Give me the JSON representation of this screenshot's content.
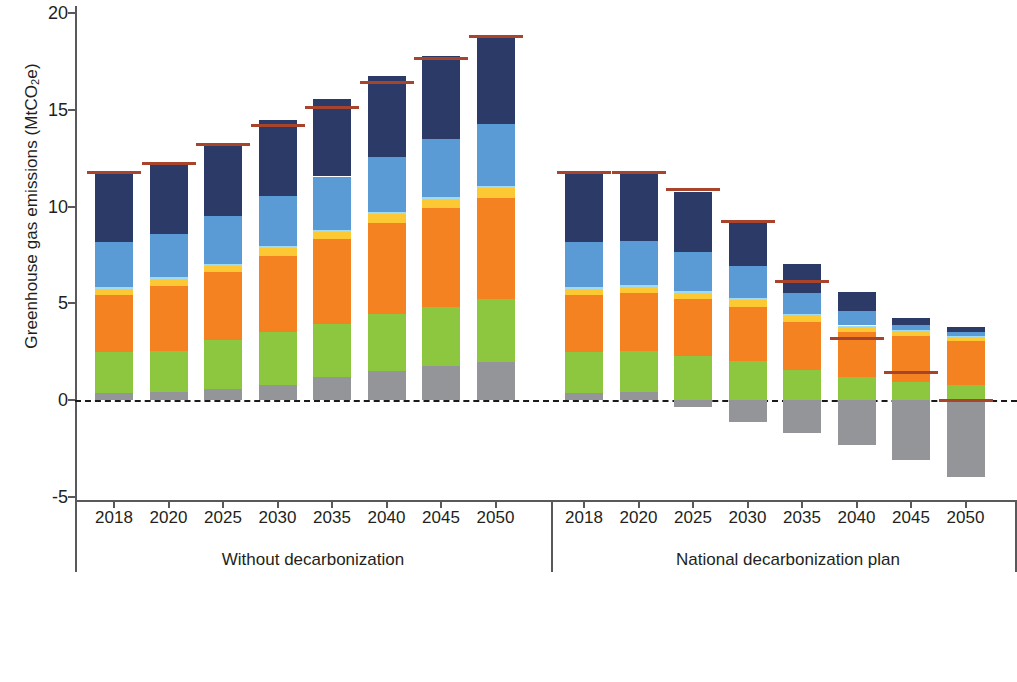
{
  "axis": {
    "y_label_main": "Greenhouse gas emissions (MtCO",
    "y_label_sub": "2",
    "y_label_tail": "e)",
    "y_ticks": [
      "20",
      "15",
      "10",
      "5",
      "0",
      "-5"
    ]
  },
  "legend": {
    "title": "Sectors",
    "items": [
      {
        "label": "Public and private transport",
        "color": "#2b3a67",
        "type": "swatch"
      },
      {
        "label": "Freight",
        "color": "#5b9bd5",
        "type": "swatch"
      },
      {
        "label": "Electricity",
        "color": "#9fdcf3",
        "type": "swatch"
      },
      {
        "label": "Buildings",
        "color": "#fcc934",
        "type": "swatch"
      },
      {
        "label": "Industry",
        "color": "#f58220",
        "type": "swatch"
      },
      {
        "label": "Waste",
        "color": "#8dc63f",
        "type": "swatch"
      },
      {
        "label": "Agriculture, livestock, and forestry",
        "color": "#939598",
        "type": "swatch"
      },
      {
        "label": "Net emissions",
        "color": "#a8432c",
        "type": "line"
      }
    ]
  },
  "chart_data": {
    "type": "bar",
    "subtype": "stacked",
    "title": "",
    "xlabel": "",
    "ylabel": "Greenhouse gas emissions (MtCO2e)",
    "ylim": [
      -5,
      20
    ],
    "ytick_step": 5,
    "grid": false,
    "zero_reference_line": true,
    "legend_position": "bottom",
    "groups": [
      {
        "name": "Without decarbonization",
        "categories": [
          "2018",
          "2020",
          "2025",
          "2030",
          "2035",
          "2040",
          "2045",
          "2050"
        ]
      },
      {
        "name": "National decarbonization plan",
        "categories": [
          "2018",
          "2020",
          "2025",
          "2030",
          "2035",
          "2040",
          "2045",
          "2050"
        ]
      }
    ],
    "series": [
      {
        "name": "Agriculture, livestock, and forestry",
        "color": "#939598",
        "values": [
          0.35,
          0.4,
          0.55,
          0.8,
          1.2,
          1.5,
          1.75,
          1.95,
          0.35,
          0.4,
          -0.35,
          -1.15,
          -1.7,
          -2.35,
          -3.1,
          -4.0
        ]
      },
      {
        "name": "Waste",
        "color": "#8dc63f",
        "values": [
          2.15,
          2.15,
          2.55,
          2.7,
          2.75,
          2.95,
          3.05,
          3.25,
          2.15,
          2.15,
          2.25,
          2.0,
          1.55,
          1.2,
          0.95,
          0.8
        ]
      },
      {
        "name": "Industry",
        "color": "#f58220",
        "values": [
          2.95,
          3.35,
          3.5,
          3.95,
          4.35,
          4.7,
          5.1,
          5.25,
          2.95,
          3.0,
          2.95,
          2.8,
          2.5,
          2.3,
          2.35,
          2.25
        ]
      },
      {
        "name": "Buildings",
        "color": "#fcc934",
        "values": [
          0.3,
          0.35,
          0.35,
          0.4,
          0.4,
          0.45,
          0.5,
          0.5,
          0.3,
          0.3,
          0.35,
          0.35,
          0.35,
          0.3,
          0.25,
          0.2
        ]
      },
      {
        "name": "Electricity",
        "color": "#9fdcf3",
        "values": [
          0.1,
          0.1,
          0.1,
          0.1,
          0.1,
          0.1,
          0.1,
          0.1,
          0.1,
          0.1,
          0.1,
          0.1,
          0.05,
          0.05,
          0.05,
          0.05
        ]
      },
      {
        "name": "Freight",
        "color": "#5b9bd5",
        "values": [
          2.3,
          2.25,
          2.45,
          2.6,
          2.75,
          2.85,
          3.0,
          3.2,
          2.3,
          2.25,
          2.0,
          1.65,
          1.1,
          0.75,
          0.3,
          0.2
        ]
      },
      {
        "name": "Public and private transport",
        "color": "#2b3a67",
        "values": [
          3.6,
          3.6,
          3.8,
          3.9,
          4.0,
          4.2,
          4.3,
          4.5,
          3.6,
          3.6,
          3.1,
          2.25,
          1.5,
          1.0,
          0.35,
          0.25
        ]
      }
    ],
    "net_emissions": {
      "name": "Net emissions",
      "color": "#a8432c",
      "values": [
        11.75,
        12.2,
        13.2,
        14.2,
        15.1,
        16.4,
        17.65,
        18.8,
        11.75,
        11.75,
        10.9,
        9.2,
        6.1,
        3.2,
        1.4,
        -0.05
      ]
    }
  }
}
